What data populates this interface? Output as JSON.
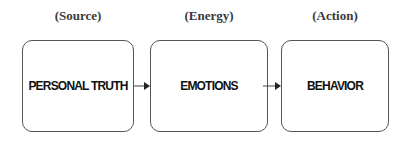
{
  "diagram": {
    "stages": [
      {
        "category": "(Source)",
        "label": "PERSONAL TRUTH"
      },
      {
        "category": "(Energy)",
        "label": "EMOTIONS"
      },
      {
        "category": "(Action)",
        "label": "BEHAVIOR"
      }
    ],
    "connectors": [
      {
        "from": "PERSONAL TRUTH",
        "to": "EMOTIONS"
      },
      {
        "from": "EMOTIONS",
        "to": "BEHAVIOR"
      }
    ],
    "colors": {
      "border": "#555555",
      "text": "#111111",
      "label": "#3a3a3a"
    }
  }
}
